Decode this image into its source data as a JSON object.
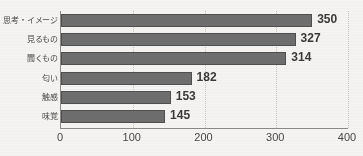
{
  "chart_data": {
    "type": "bar",
    "orientation": "horizontal",
    "title": "",
    "xlabel": "",
    "ylabel": "",
    "categories": [
      "思考・イメージ",
      "見るもの",
      "聞くもの",
      "匂い",
      "触感",
      "味覚"
    ],
    "values": [
      350,
      327,
      314,
      182,
      153,
      145
    ],
    "value_labels": [
      "350",
      "327",
      "314",
      "182",
      "153",
      "145"
    ],
    "xlim": [
      0,
      400
    ],
    "xticks": [
      0,
      100,
      200,
      300,
      400
    ],
    "xtick_labels": [
      "0",
      "100",
      "200",
      "300",
      "400"
    ],
    "grid": true,
    "grid_axis": "x",
    "legend": false,
    "bar_color": "#6e6e6e",
    "bar_edge_color": "#4f4f4f",
    "axis_color": "#8c8a87",
    "grid_color": "#c6c4c1",
    "text_color": "#4a4846",
    "value_label_color": "#3a3a3a",
    "background_color": "#f4f3f1"
  },
  "artifacts": {
    "top_clipped_text": ""
  }
}
